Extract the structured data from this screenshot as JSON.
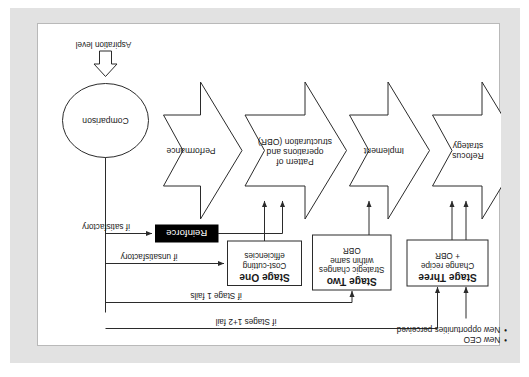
{
  "diagram": {
    "orientation": "rotated-180",
    "colors": {
      "page_background": "#ffffff",
      "mat_background": "#e2e2e2",
      "stroke": "#2b2b2b",
      "reinforce_fill": "#000000",
      "reinforce_text": "#ffffff",
      "text": "#1a1a1a"
    },
    "aspiration": {
      "label": "Aspiration level",
      "arrow": "block-arrow-down-icon"
    },
    "comparison": {
      "label": "Comparison",
      "shape": "ellipse"
    },
    "reinforce": {
      "label": "Reinforce",
      "shape": "filled-black-box"
    },
    "chevrons": [
      {
        "id": "performance",
        "label": "Performance"
      },
      {
        "id": "pattern-of-operations",
        "label": "Pattern of\noperations and\nstructuration (OBR)"
      },
      {
        "id": "implement",
        "label": "Implement"
      },
      {
        "id": "refocus-strategy",
        "label": "Refocus\nstrategy"
      }
    ],
    "stages": [
      {
        "id": "stage-one",
        "title": "Stage One",
        "subtitle": "Cost-cutting\nefficiencies"
      },
      {
        "id": "stage-two",
        "title": "Stage Two",
        "subtitle": "Strategic changes\nwithin same\nOBR"
      },
      {
        "id": "stage-three",
        "title": "Stage Three",
        "subtitle": "Change recipe\n+ OBR"
      }
    ],
    "edge_labels": [
      {
        "id": "if-satisfactory",
        "text": "if satisfactory"
      },
      {
        "id": "if-unsatisfactory",
        "text": "if unsatisfactory"
      },
      {
        "id": "if-stage-1-fails",
        "text": "if Stage 1 fails"
      },
      {
        "id": "if-stages-1-2-fail",
        "text": "if Stages 1+2 fail"
      }
    ],
    "triggers": {
      "items": [
        {
          "bullet": "•",
          "text": "New CEO"
        },
        {
          "bullet": "•",
          "text": "New opportunities perceived"
        }
      ]
    }
  }
}
